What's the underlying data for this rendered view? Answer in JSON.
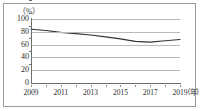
{
  "chart_data": {
    "type": "line",
    "title": "",
    "subtitle": "",
    "xlabel": "（年）",
    "ylabel": "（%）",
    "unit_label_y": "（%）",
    "unit_label_x": "（年）",
    "grid": true,
    "legend": false,
    "legend_position": "none",
    "xlim": [
      2009,
      2019
    ],
    "ylim": [
      0,
      100
    ],
    "ytick_labels": [
      "100",
      "80",
      "60",
      "40",
      "20",
      "0"
    ],
    "ytick_values": [
      100,
      80,
      60,
      40,
      20,
      0
    ],
    "xtick_labels": [
      "2009",
      "2011",
      "2013",
      "2015",
      "2017",
      "2019"
    ],
    "xtick_values": [
      2009,
      2011,
      2013,
      2015,
      2017,
      2019
    ],
    "x": [
      2009,
      2010,
      2011,
      2012,
      2013,
      2014,
      2015,
      2016,
      2017,
      2018,
      2019
    ],
    "values": [
      84,
      82,
      79,
      77,
      75,
      72,
      69,
      65,
      64,
      66,
      68
    ],
    "series": [
      {
        "name": "",
        "values": [
          84,
          82,
          79,
          77,
          75,
          72,
          69,
          65,
          64,
          66,
          68
        ],
        "color": "#333333"
      }
    ],
    "line_color": "#333333",
    "grid_color": "#b9b9b9",
    "axis_color": "#6e6e6e",
    "frame_color": "#9a9a9a",
    "background": "#ffffff"
  }
}
